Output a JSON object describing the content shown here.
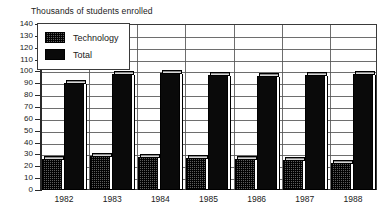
{
  "chart_data": {
    "type": "bar",
    "title": "Thousands of students enrolled",
    "xlabel": "",
    "ylabel": "",
    "ylim": [
      0,
      140
    ],
    "ytick_step": 10,
    "yticks": [
      140,
      130,
      120,
      110,
      100,
      90,
      80,
      70,
      60,
      50,
      40,
      30,
      20,
      10,
      0
    ],
    "grid": true,
    "legend_position": "top-left",
    "categories": [
      "1982",
      "1983",
      "1984",
      "1985",
      "1986",
      "1987",
      "1988"
    ],
    "series": [
      {
        "name": "Technology",
        "values": [
          26,
          29,
          28,
          27,
          26,
          25,
          23
        ],
        "color": "#5c5c5c",
        "pattern": "dithered"
      },
      {
        "name": "Total",
        "values": [
          90,
          98,
          99,
          97,
          96,
          97,
          98
        ],
        "color": "#0a0a0a",
        "pattern": "solid"
      }
    ]
  },
  "legend": {
    "items": [
      {
        "label": "Technology"
      },
      {
        "label": "Total"
      }
    ]
  },
  "colors": {
    "technology": "#5c5c5c",
    "total": "#0a0a0a",
    "axis": "#2a2a2a",
    "grid": "#555555",
    "background": "#ffffff"
  }
}
